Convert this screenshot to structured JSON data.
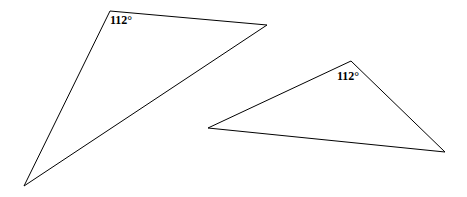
{
  "diagram": {
    "triangles": [
      {
        "name": "triangle-1",
        "points": [
          [
            110,
            11
          ],
          [
            267,
            25
          ],
          [
            24,
            186
          ]
        ],
        "angle_label": "112°",
        "label_pos": [
          110,
          24
        ]
      },
      {
        "name": "triangle-2",
        "points": [
          [
            208,
            128
          ],
          [
            351,
            61
          ],
          [
            445,
            152
          ]
        ],
        "angle_label": "112°",
        "label_pos": [
          337,
          80
        ]
      }
    ],
    "stroke_color": "#000000",
    "background": "#ffffff"
  }
}
